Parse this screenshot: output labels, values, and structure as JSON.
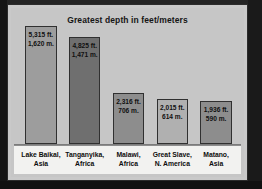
{
  "figure": {
    "title": "Greatest depth in feet/meters",
    "background_color": "#c6c6c6",
    "frame_color": "#2b2b2b",
    "label_strip_color": "#f2f2f0"
  },
  "chart_data": {
    "type": "bar",
    "title": "Greatest depth in feet/meters",
    "xlabel": "",
    "ylabel": "Greatest depth",
    "grid": false,
    "legend": "none",
    "unit_primary": "ft.",
    "unit_secondary": "m.",
    "ylim": [
      0,
      5315
    ],
    "categories": [
      "Lake Baikal, Asia",
      "Tanganyika, Africa",
      "Malawi, Africa",
      "Great Slave, N. America",
      "Matano, Asia"
    ],
    "values": [
      5315,
      4825,
      2316,
      2015,
      1936
    ],
    "values_meters": [
      1620,
      1471,
      706,
      614,
      590
    ],
    "bars": [
      {
        "name_line1": "Lake Baikal,",
        "name_line2": "Asia",
        "feet_label": "5,315 ft.",
        "meters_label": "1,620 m.",
        "feet": 5315,
        "meters": 1620,
        "color": "#9d9d9d"
      },
      {
        "name_line1": "Tanganyika,",
        "name_line2": "Africa",
        "feet_label": "4,825 ft.",
        "meters_label": "1,471 m.",
        "feet": 4825,
        "meters": 1471,
        "color": "#6f6f6f"
      },
      {
        "name_line1": "Malawi,",
        "name_line2": "Africa",
        "feet_label": "2,316 ft.",
        "meters_label": "706 m.",
        "feet": 2316,
        "meters": 706,
        "color": "#8d8d8d"
      },
      {
        "name_line1": "Great Slave,",
        "name_line2": "N. America",
        "feet_label": "2,015 ft.",
        "meters_label": "614 m.",
        "feet": 2015,
        "meters": 614,
        "color": "#b0b0b0"
      },
      {
        "name_line1": "Matano,",
        "name_line2": "Asia",
        "feet_label": "1,936 ft.",
        "meters_label": "590 m.",
        "feet": 1936,
        "meters": 590,
        "color": "#8d8d8d"
      }
    ]
  }
}
